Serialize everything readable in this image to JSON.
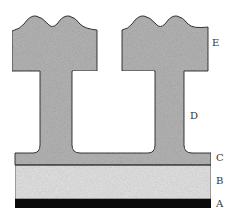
{
  "diagram": {
    "type": "layered cross-section with two T-shaped pillars",
    "labels": {
      "E": "E",
      "D": "D",
      "C": "C",
      "B": "B",
      "A": "A"
    },
    "colors": {
      "pillar_fill": "#b8b8b8",
      "layer_c_fill": "#b0b0b0",
      "layer_b_fill": "#e6e6e6",
      "layer_a_fill": "#0a0a0a",
      "outline": "#333333"
    }
  }
}
